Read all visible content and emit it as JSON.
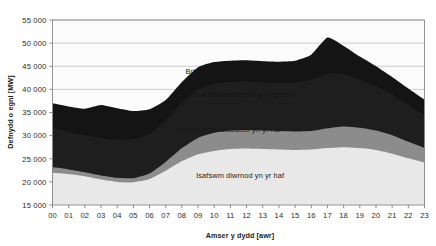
{
  "chart_data": {
    "type": "area",
    "title": "",
    "xlabel": "Amser y dydd [awr]",
    "ylabel": "Defnydd o egni [MW]",
    "xlim": [
      0,
      23
    ],
    "ylim": [
      15000,
      55000
    ],
    "ytick_step": 5000,
    "grid": true,
    "legend_position": "in-plot-annotations",
    "stacked": true,
    "x": [
      0,
      1,
      2,
      3,
      4,
      5,
      6,
      7,
      8,
      9,
      10,
      11,
      12,
      13,
      14,
      15,
      16,
      17,
      18,
      19,
      20,
      21,
      22,
      23
    ],
    "xtick_labels": [
      "00",
      "01",
      "02",
      "03",
      "04",
      "05",
      "06",
      "07",
      "08",
      "09",
      "10",
      "11",
      "12",
      "13",
      "14",
      "15",
      "16",
      "17",
      "18",
      "19",
      "20",
      "21",
      "22",
      "23"
    ],
    "ytick_labels": [
      "15 000",
      "20 000",
      "25 000",
      "30 000",
      "35 000",
      "40 000",
      "45 000",
      "50 000",
      "55 000"
    ],
    "ytick_values": [
      15000,
      20000,
      25000,
      30000,
      35000,
      40000,
      45000,
      50000,
      55000
    ],
    "series": [
      {
        "name": "Isafswm diwrnod yn yr haf",
        "color": "#e8e8e8",
        "cumulative_top": [
          22000,
          21700,
          21200,
          20500,
          20000,
          19900,
          20600,
          22400,
          24500,
          26000,
          26700,
          27100,
          27200,
          27100,
          27000,
          26900,
          27000,
          27300,
          27500,
          27300,
          26900,
          26100,
          25100,
          24200
        ]
      },
      {
        "name": "Diwrnod nodweddiadol yn yr haf",
        "color": "#8c8c8c",
        "cumulative_top": [
          23200,
          22700,
          22100,
          21400,
          20900,
          20800,
          21800,
          24300,
          27300,
          29500,
          30600,
          31100,
          31200,
          31100,
          31000,
          30900,
          31000,
          31600,
          32000,
          31700,
          31100,
          30100,
          28700,
          27400
        ]
      },
      {
        "name": "Diwrnod nodweddiadol yn y gaeaf",
        "color": "#1e1e1e",
        "cumulative_top": [
          31700,
          30800,
          30100,
          29500,
          29100,
          29200,
          30400,
          33200,
          37200,
          39900,
          41200,
          41600,
          41700,
          41500,
          41400,
          41400,
          42100,
          43500,
          43300,
          42100,
          40700,
          38900,
          36600,
          34400
        ]
      },
      {
        "name": "Brig nodweddiadol yn y gaeaf",
        "color": "#141414",
        "cumulative_top": [
          37000,
          36300,
          35800,
          36600,
          35900,
          35300,
          35700,
          37700,
          41600,
          44800,
          45900,
          46200,
          46300,
          46100,
          46000,
          46200,
          47500,
          51200,
          49400,
          47100,
          45000,
          42700,
          40200,
          37800
        ]
      }
    ],
    "annotations": [
      {
        "text": "Brig nodweddiadol yn y gaeaf",
        "x_hour": 11.3,
        "value": 43800,
        "on": "dark"
      },
      {
        "text": "Diwrnod nodweddiadol yn y gaeaf",
        "x_hour": 11.3,
        "value": 39000,
        "on": "dark"
      },
      {
        "text": "Diwrnod nodweddiadol yn yr haf",
        "x_hour": 10.8,
        "value": 31400,
        "on": "mid"
      },
      {
        "text": "Isafswm diwrnod yn yr haf",
        "x_hour": 11.6,
        "value": 21400,
        "on": "light"
      }
    ]
  },
  "colors": {
    "band_lightest": "#e8e8e8",
    "band_mid": "#8c8c8c",
    "band_dark": "#1e1e1e",
    "band_darkest": "#141414",
    "grid": "#b9b9b9",
    "frame": "#8c8c8c",
    "text": "#1a1a1a",
    "background": "#ffffff"
  }
}
